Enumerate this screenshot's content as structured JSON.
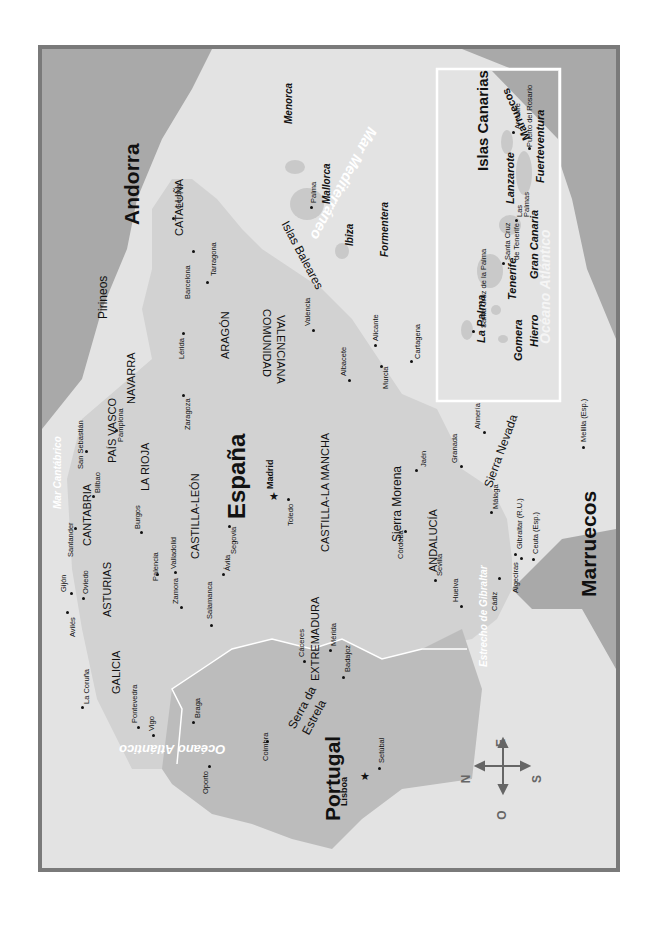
{
  "map": {
    "orientation": "rotated 90° counter-clockwise (north points left)",
    "colors": {
      "frame": "#7a7a7a",
      "sea": "#e3e3e3",
      "spain_land": "#d2d2d2",
      "portugal_land": "#bcbcbc",
      "neighbor_land": "#a9a9a9",
      "border_line": "#ffffff",
      "inset_border": "#ffffff"
    },
    "countries": {
      "spain": "España",
      "portugal": "Portugal",
      "andorra": "Andorra",
      "morocco": "Marruecos",
      "morocco_inset": "Marruecos"
    },
    "seas": {
      "cantabrico": "Mar Cantábrico",
      "mediterraneo": "Mar Mediterráneo",
      "atlantico": "Océano Atlántico",
      "atlantico_inset": "Océano Atlántico",
      "gibraltar": "Estrecho de Gibraltar"
    },
    "mountains": {
      "pirineos": "Pirineos",
      "sierra_morena": "Sierra Morena",
      "sierra_nevada": "Sierra Nevada",
      "serra_da": "Serra da",
      "estrela": "Estrela"
    },
    "regions": {
      "galicia": "GALICIA",
      "asturias": "ASTURIAS",
      "cantabria": "CANTABRIA",
      "pais_vasco": "PAÍS VASCO",
      "navarra": "NAVARRA",
      "la_rioja": "LA RIOJA",
      "aragon": "ARAGÓN",
      "cataluna": "CATALUÑA",
      "castilla_leon": "CASTILLA-LEÓN",
      "castilla_la_mancha": "CASTILLA-LA MANCHA",
      "comunidad": "COMUNIDAD",
      "valenciana": "VALENCIANA",
      "extremadura": "EXTREMADURA",
      "andalucia": "ANDALUCÍA"
    },
    "capitals": {
      "madrid": "Madrid",
      "lisboa": "Lisboa"
    },
    "cities": {
      "gerona": "Gerona",
      "barcelona": "Barcelona",
      "tarragona": "Tarragona",
      "lerida": "Lérida",
      "zaragoza": "Zaragoza",
      "pamplona": "Pamplona",
      "san_sebastian": "San Sebastián",
      "bilbao": "Bilbao",
      "santander": "Santander",
      "burgos": "Burgos",
      "gijon": "Gijón",
      "oviedo": "Oviedo",
      "aviles": "Avilés",
      "la_coruna": "La Coruña",
      "pontevedra": "Pontevedra",
      "vigo": "Vigo",
      "palencia": "Palencia",
      "valladolid": "Valladolid",
      "zamora": "Zamora",
      "salamanca": "Salamanca",
      "avila": "Ávila",
      "segovia": "Segovia",
      "toledo": "Toledo",
      "caceres": "Cáceres",
      "merida": "Mérida",
      "badajoz": "Badajoz",
      "valencia": "Valencia",
      "alicante": "Alicante",
      "albacete": "Albacete",
      "murcia": "Murcia",
      "cartagena": "Cartagena",
      "almeria": "Almería",
      "granada": "Granada",
      "jaen": "Jaén",
      "malaga": "Málaga",
      "cordoba": "Córdoba",
      "sevilla": "Sevilla",
      "huelva": "Huelva",
      "cadiz": "Cádiz",
      "algeciras": "Algeciras",
      "gibraltar": "Gibraltar (R.U.)",
      "ceuta": "Ceuta (Esp.)",
      "melilla": "Melilla (Esp.)",
      "palma": "Palma",
      "oporto": "Oporto",
      "braga": "Braga",
      "coimbra": "Coimbra",
      "setubal": "Setúbal"
    },
    "balearic": {
      "group": "Islas Baleares",
      "menorca": "Menorca",
      "mallorca": "Mallorca",
      "ibiza": "Ibiza",
      "formentera": "Formentera"
    },
    "inset": {
      "title": "Islas Canarias",
      "islands": {
        "la_palma": "La Palma",
        "tenerife": "Tenerife",
        "gomera": "Gomera",
        "hierro": "Hierro",
        "gran_canaria": "Gran Canaria",
        "lanzarote": "Lanzarote",
        "fuerteventura": "Fuerteventura"
      },
      "cities": {
        "santa_cruz_palma": "Santa Cruz de la Palma",
        "santa_cruz_tenerife_1": "Santa Cruz",
        "santa_cruz_tenerife_2": "de Tenerife",
        "las_palmas_1": "Las",
        "las_palmas_2": "Palmas",
        "arrecife": "Arrecife",
        "puerto_rosario": "Puerto del Rosario"
      }
    },
    "compass": {
      "north": "N",
      "south": "S",
      "east": "E",
      "west": "O"
    }
  }
}
